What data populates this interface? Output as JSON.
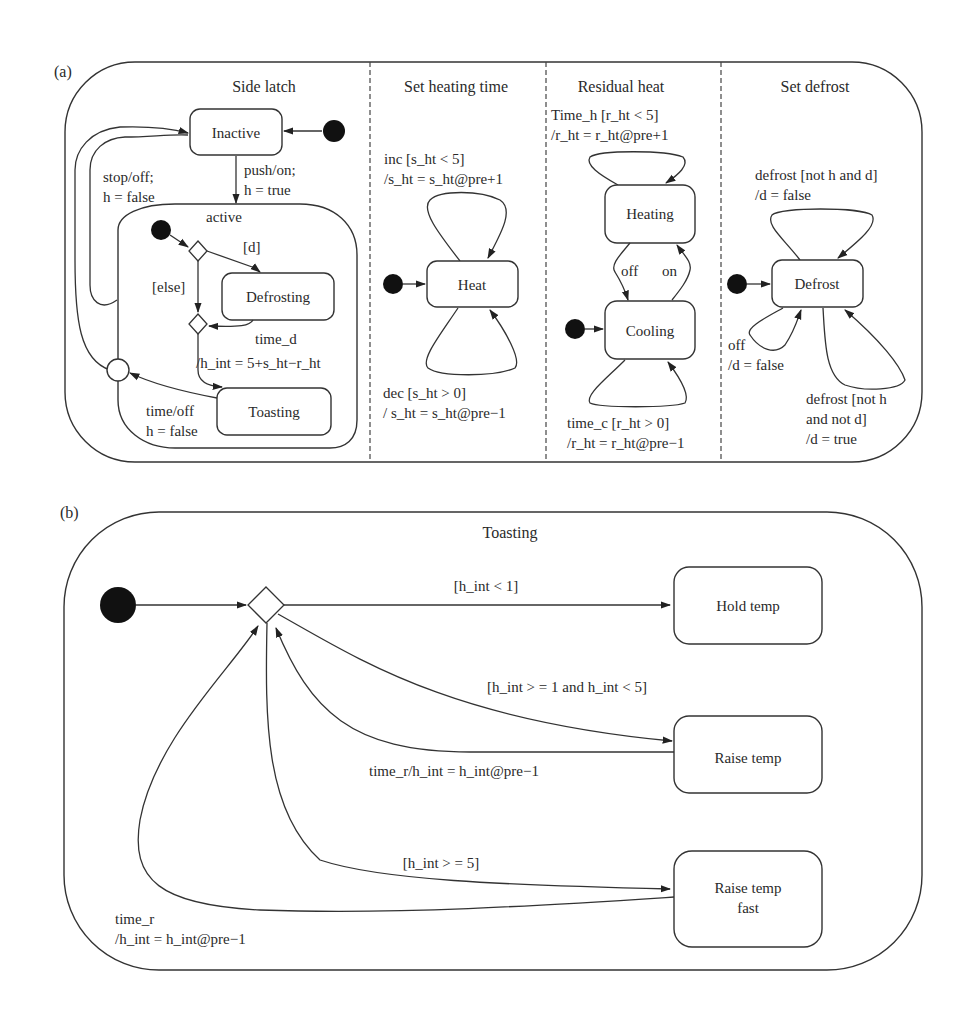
{
  "figure": {
    "panel_a_tag": "(a)",
    "panel_b_tag": "(b)"
  },
  "panel_a": {
    "regions": [
      {
        "title": "Side latch",
        "states": {
          "inactive": "Inactive",
          "active": "active",
          "defrosting": "Defrosting",
          "toasting": "Toasting"
        },
        "transitions": {
          "stop_off_1": "stop/off;",
          "stop_off_2": "h = false",
          "push_on_1": "push/on;",
          "push_on_2": "h = true",
          "guard_d": "[d]",
          "guard_else": "[else]",
          "time_d": "time_d",
          "h_int_action": "/h_int = 5+s_ht−r_ht",
          "time_off_1": "time/off",
          "time_off_2": "h = false"
        }
      },
      {
        "title": "Set heating time",
        "states": {
          "heat": "Heat"
        },
        "transitions": {
          "inc_1": "inc [s_ht < 5]",
          "inc_2": "/s_ht = s_ht@pre+1",
          "dec_1": "dec [s_ht > 0]",
          "dec_2": "/ s_ht = s_ht@pre−1"
        }
      },
      {
        "title": "Residual heat",
        "states": {
          "heating": "Heating",
          "cooling": "Cooling"
        },
        "transitions": {
          "time_h_1": "Time_h [r_ht < 5]",
          "time_h_2": "/r_ht = r_ht@pre+1",
          "off": "off",
          "on": "on",
          "time_c_1": "time_c [r_ht > 0]",
          "time_c_2": "/r_ht = r_ht@pre−1"
        }
      },
      {
        "title": "Set defrost",
        "states": {
          "defrost": "Defrost"
        },
        "transitions": {
          "defrost_top_1": "defrost [not h and d]",
          "defrost_top_2": "/d = false",
          "off_1": "off",
          "off_2": "/d = false",
          "defrost_bot_1": "defrost [not h",
          "defrost_bot_2": "and not d]",
          "defrost_bot_3": "/d = true"
        }
      }
    ]
  },
  "panel_b": {
    "title": "Toasting",
    "states": {
      "hold_temp": "Hold temp",
      "raise_temp": "Raise temp",
      "raise_temp_fast_1": "Raise temp",
      "raise_temp_fast_2": "fast"
    },
    "transitions": {
      "guard_lt1": "[h_int < 1]",
      "guard_mid": "[h_int > = 1 and h_int < 5]",
      "time_r_mid": "time_r/h_int = h_int@pre−1",
      "guard_ge5": "[h_int > = 5]",
      "time_r_fast_1": "time_r",
      "time_r_fast_2": "/h_int = h_int@pre−1"
    }
  }
}
